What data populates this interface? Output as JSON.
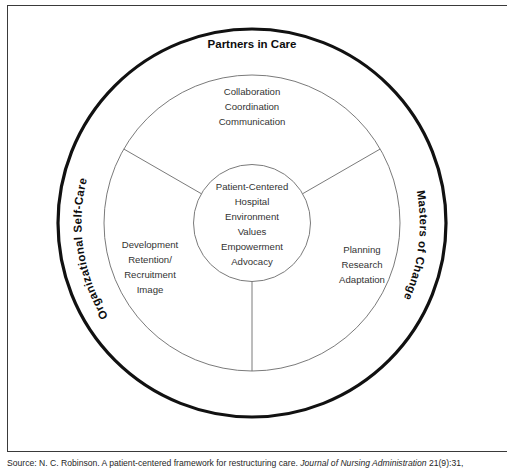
{
  "figure": {
    "type": "concentric-circles-diagram",
    "outer_ring_labels": {
      "top": "Partners in Care",
      "left": "Organizational Self-Care",
      "right": "Masters of Change"
    },
    "middle_ring_segments": [
      {
        "position": "top",
        "lines": [
          "Collaboration",
          "Coordination",
          "Communication"
        ]
      },
      {
        "position": "left",
        "lines": [
          "Development",
          "Retention/",
          "Recruitment",
          "Image"
        ]
      },
      {
        "position": "right",
        "lines": [
          "Planning",
          "Research",
          "Adaptation"
        ]
      }
    ],
    "core_lines": [
      "Patient-Centered",
      "Hospital",
      "Environment",
      "Values",
      "Empowerment",
      "Advocacy"
    ],
    "colors": {
      "outer_stroke": "#111111",
      "inner_stroke": "#6b6b6b",
      "frame": "#3a3a3a",
      "text": "#1c1c1c",
      "background": "#ffffff"
    }
  },
  "source": {
    "prefix": "Source: N. C. Robinson. A patient-centered framework for restructuring care.",
    "journal": "Journal of Nursing Administration",
    "citation": "21(9):31,"
  }
}
